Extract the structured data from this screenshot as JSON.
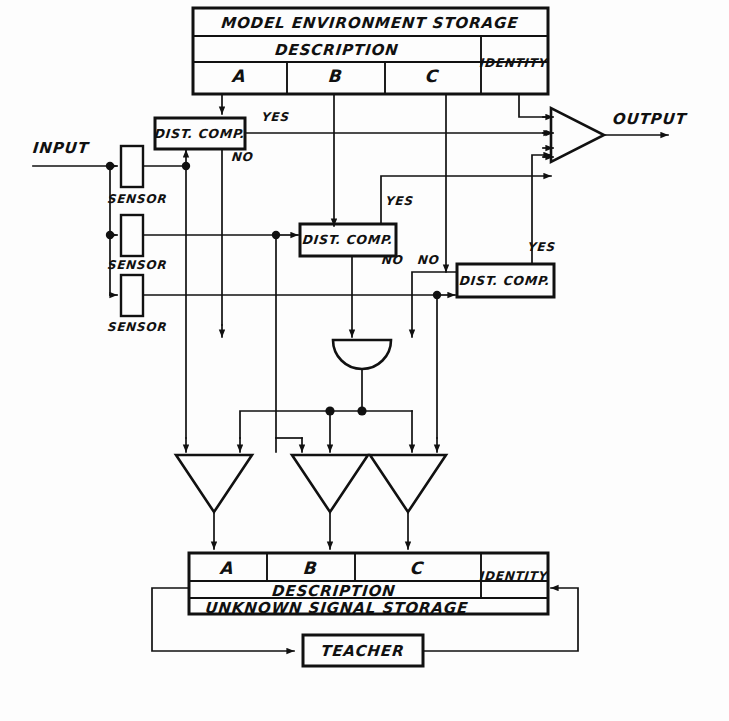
{
  "diagram": {
    "background_color": "#fdfdfd",
    "ink_color": "#111111"
  },
  "model_storage": {
    "title": "MODEL ENVIRONMENT STORAGE",
    "description_label": "DESCRIPTION",
    "identity_label": "IDENTITY",
    "columns": [
      "A",
      "B",
      "C"
    ]
  },
  "unknown_storage": {
    "title": "UNKNOWN SIGNAL STORAGE",
    "description_label": "DESCRIPTION",
    "identity_label": "IDENTITY",
    "columns": [
      "A",
      "B",
      "C"
    ]
  },
  "input": {
    "label": "INPUT"
  },
  "output": {
    "label": "OUTPUT"
  },
  "sensors": [
    {
      "label": "SENSOR"
    },
    {
      "label": "SENSOR"
    },
    {
      "label": "SENSOR"
    }
  ],
  "comparators": [
    {
      "label": "DIST. COMP.",
      "yes": "YES",
      "no": "NO"
    },
    {
      "label": "DIST. COMP.",
      "yes": "YES",
      "no": "NO"
    },
    {
      "label": "DIST. COMP.",
      "yes": "YES",
      "no": "NO"
    }
  ],
  "teacher": {
    "label": "TEACHER"
  },
  "gates": {
    "or_gate_name": "or-gate",
    "and_gate_output_name": "output-and-gate",
    "writer_gates": [
      "writer-gate-a",
      "writer-gate-b",
      "writer-gate-c"
    ]
  }
}
